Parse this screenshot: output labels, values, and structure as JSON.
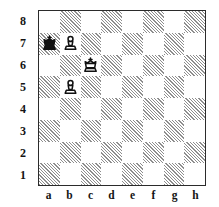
{
  "diagram": {
    "orientation": "white",
    "board_border_color": "#2b2b2b",
    "light_square_color": "#ffffff",
    "dark_square_color": "#8e8e8e",
    "piece_black_color": "#111111",
    "piece_white_color": "#ffffff"
  },
  "labels": {
    "ranks": [
      "8",
      "7",
      "6",
      "5",
      "4",
      "3",
      "2",
      "1"
    ],
    "files": [
      "a",
      "b",
      "c",
      "d",
      "e",
      "f",
      "g",
      "h"
    ]
  },
  "chart_data": {
    "type": "table",
    "xlabel": "files",
    "ylabel": "ranks",
    "categories": [
      "a",
      "b",
      "c",
      "d",
      "e",
      "f",
      "g",
      "h"
    ],
    "ranks": [
      "8",
      "7",
      "6",
      "5",
      "4",
      "3",
      "2",
      "1"
    ],
    "square_colors": [
      [
        "light",
        "dark",
        "light",
        "dark",
        "light",
        "dark",
        "light",
        "dark"
      ],
      [
        "dark",
        "light",
        "dark",
        "light",
        "dark",
        "light",
        "dark",
        "light"
      ],
      [
        "light",
        "dark",
        "light",
        "dark",
        "light",
        "dark",
        "light",
        "dark"
      ],
      [
        "dark",
        "light",
        "dark",
        "light",
        "dark",
        "light",
        "dark",
        "light"
      ],
      [
        "light",
        "dark",
        "light",
        "dark",
        "light",
        "dark",
        "light",
        "dark"
      ],
      [
        "dark",
        "light",
        "dark",
        "light",
        "dark",
        "light",
        "dark",
        "light"
      ],
      [
        "light",
        "dark",
        "light",
        "dark",
        "light",
        "dark",
        "light",
        "dark"
      ],
      [
        "dark",
        "light",
        "dark",
        "light",
        "dark",
        "light",
        "dark",
        "light"
      ]
    ],
    "pieces": [
      {
        "square": "a7",
        "color": "black",
        "type": "king",
        "icon": "black-king-icon"
      },
      {
        "square": "b7",
        "color": "white",
        "type": "pawn",
        "icon": "white-pawn-icon"
      },
      {
        "square": "c6",
        "color": "white",
        "type": "king",
        "icon": "white-king-icon"
      },
      {
        "square": "b5",
        "color": "white",
        "type": "pawn",
        "icon": "white-pawn-icon"
      }
    ],
    "placement": [
      [
        "",
        "",
        "",
        "",
        "",
        "",
        "",
        ""
      ],
      [
        "bk",
        "wp",
        "",
        "",
        "",
        "",
        "",
        ""
      ],
      [
        "",
        "",
        "wk",
        "",
        "",
        "",
        "",
        ""
      ],
      [
        "",
        "wp",
        "",
        "",
        "",
        "",
        "",
        ""
      ],
      [
        "",
        "",
        "",
        "",
        "",
        "",
        "",
        ""
      ],
      [
        "",
        "",
        "",
        "",
        "",
        "",
        "",
        ""
      ],
      [
        "",
        "",
        "",
        "",
        "",
        "",
        "",
        ""
      ],
      [
        "",
        "",
        "",
        "",
        "",
        "",
        "",
        ""
      ]
    ],
    "fen": "8/kP6/2K5/1P6/8/8/8/8",
    "piece_count": 4
  }
}
